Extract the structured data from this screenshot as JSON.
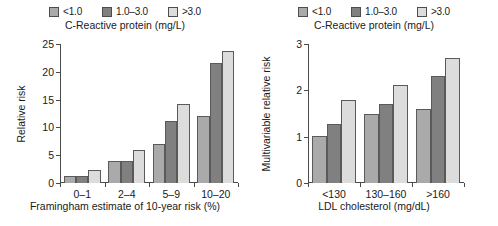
{
  "chart_data": [
    {
      "type": "bar",
      "panel": "left",
      "title": "",
      "legend_title": "C-Reactive protein (mg/L)",
      "legend_position": "top",
      "grid": false,
      "xlabel": "Framingham estimate of 10-year risk (%)",
      "ylabel": "Relative risk",
      "categories": [
        "0–1",
        "2–4",
        "5–9",
        "10–20"
      ],
      "ylim": [
        0,
        25
      ],
      "yticks": [
        0,
        5,
        10,
        15,
        20,
        25
      ],
      "ytick_labels": [
        "0",
        "5",
        "10",
        "15",
        "20",
        "25"
      ],
      "series": [
        {
          "name": "<1.0",
          "color": "#aaaaaa",
          "values": [
            1.3,
            4.0,
            7.0,
            12.0
          ]
        },
        {
          "name": "1.0–3.0",
          "color": "#808080",
          "values": [
            1.3,
            3.9,
            11.2,
            21.5
          ]
        },
        {
          "name": ">3.0",
          "color": "#dcdcdc",
          "values": [
            2.3,
            6.0,
            14.2,
            23.8
          ]
        }
      ]
    },
    {
      "type": "bar",
      "panel": "right",
      "title": "",
      "legend_title": "C-Reactive protein (mg/L)",
      "legend_position": "top",
      "grid": false,
      "xlabel": "LDL cholesterol (mg/dL)",
      "ylabel": "Multivariable relative risk",
      "categories": [
        "<130",
        "130–160",
        ">160"
      ],
      "ylim": [
        0,
        3
      ],
      "yticks": [
        0,
        1,
        2,
        3
      ],
      "ytick_labels": [
        "0",
        "1",
        "2",
        "3"
      ],
      "series": [
        {
          "name": "<1.0",
          "color": "#aaaaaa",
          "values": [
            1.02,
            1.5,
            1.6
          ]
        },
        {
          "name": "1.0–3.0",
          "color": "#808080",
          "values": [
            1.28,
            1.7,
            2.3
          ]
        },
        {
          "name": ">3.0",
          "color": "#dcdcdc",
          "values": [
            1.8,
            2.12,
            2.7
          ]
        }
      ]
    }
  ],
  "left_panel": {
    "legend": {
      "items": [
        {
          "label": "<1.0",
          "swatch": "#aaaaaa"
        },
        {
          "label": "1.0–3.0",
          "swatch": "#808080"
        },
        {
          "label": ">3.0",
          "swatch": "#dcdcdc"
        }
      ],
      "title": "C-Reactive protein (mg/L)"
    },
    "ylabel": "Relative risk",
    "xlabel": "Framingham estimate of 10-year risk (%)",
    "ytick_labels": [
      "25",
      "20",
      "15",
      "10",
      "5",
      "0"
    ],
    "xtick_labels": [
      "0–1",
      "2–4",
      "5–9",
      "10–20"
    ]
  },
  "right_panel": {
    "legend": {
      "items": [
        {
          "label": "<1.0",
          "swatch": "#aaaaaa"
        },
        {
          "label": "1.0–3.0",
          "swatch": "#808080"
        },
        {
          "label": ">3.0",
          "swatch": "#dcdcdc"
        }
      ],
      "title": "C-Reactive protein (mg/L)"
    },
    "ylabel": "Multivariable relative risk",
    "xlabel": "LDL cholesterol (mg/dL)",
    "ytick_labels": [
      "3",
      "2",
      "1",
      "0"
    ],
    "xtick_labels": [
      "<130",
      "130–160",
      ">160"
    ]
  }
}
